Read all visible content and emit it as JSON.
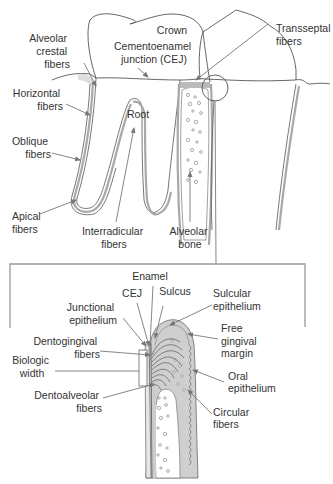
{
  "figure": {
    "upper_panel": {
      "labels": {
        "crown": "Crown",
        "cej_line1": "Cementoenamel",
        "cej_line2": "junction (CEJ)",
        "alveolar_crestal_1": "Alveolar",
        "alveolar_crestal_2": "crestal",
        "alveolar_crestal_3": "fibers",
        "transseptal_1": "Transseptal",
        "transseptal_2": "fibers",
        "horizontal_1": "Horizontal",
        "horizontal_2": "fibers",
        "root": "Root",
        "oblique_1": "Oblique",
        "oblique_2": "fibers",
        "apical_1": "Apical",
        "apical_2": "fibers",
        "interradicular_1": "Interradicular",
        "interradicular_2": "fibers",
        "alveolar_bone_1": "Alveolar",
        "alveolar_bone_2": "bone"
      }
    },
    "inset_panel": {
      "labels": {
        "enamel": "Enamel",
        "cej": "CEJ",
        "sulcus": "Sulcus",
        "sulcular_1": "Sulcular",
        "sulcular_2": "epithelium",
        "junctional_1": "Junctional",
        "junctional_2": "epithelium",
        "free_gingival_1": "Free",
        "free_gingival_2": "gingival",
        "free_gingival_3": "margin",
        "dentogingival_1": "Dentogingival",
        "dentogingival_2": "fibers",
        "biologic_1": "Biologic",
        "biologic_2": "width",
        "oral_1": "Oral",
        "oral_2": "epithelium",
        "dentoalveolar_1": "Dentoalveolar",
        "dentoalveolar_2": "fibers",
        "circular_1": "Circular",
        "circular_2": "fibers"
      }
    },
    "colors": {
      "line": "#555555",
      "leader": "#777777",
      "gingiva": "#cfcfcf",
      "pdl": "#a8a8a8",
      "box": "#999999",
      "background": "#ffffff"
    }
  }
}
